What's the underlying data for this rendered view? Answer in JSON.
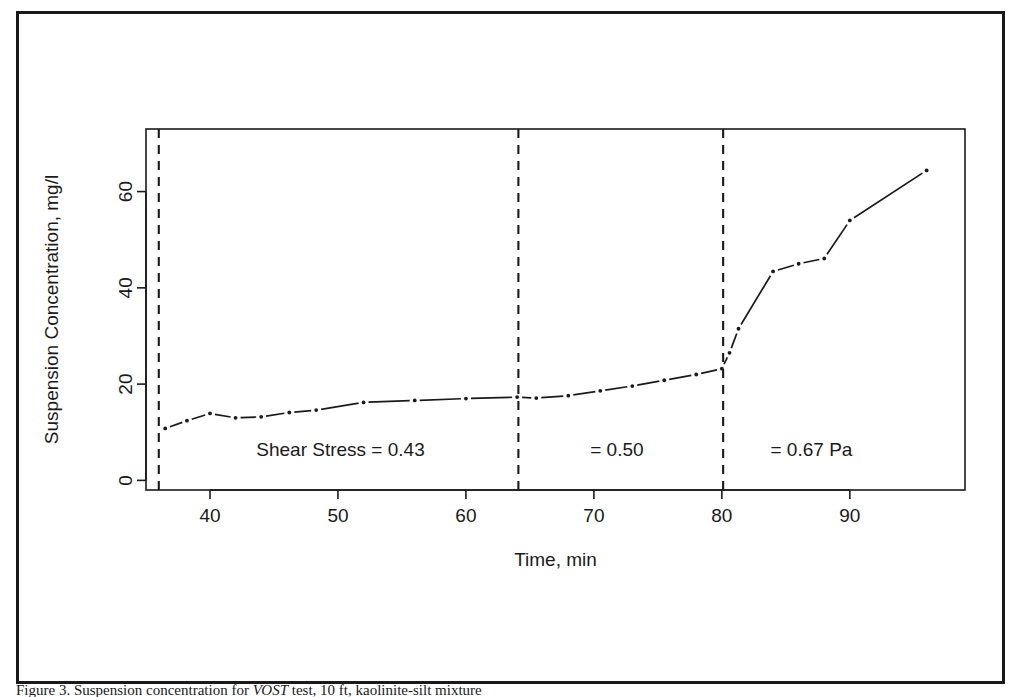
{
  "figure": {
    "caption_prefix": "Figure 3.",
    "caption_text": "Suspension concentration for",
    "caption_emphasis": "VOST",
    "caption_rest": "test, 10 ft, kaolinite-silt mixture"
  },
  "chart_data": {
    "type": "scatter",
    "title": "",
    "subtitle": "",
    "xlabel": "Time, min",
    "ylabel": "Suspension Concentration, mg/l",
    "xlim": [
      35.0,
      99.0
    ],
    "ylim": [
      -2.0,
      73.0
    ],
    "xticks": [
      40,
      50,
      60,
      70,
      80,
      90
    ],
    "yticks": [
      0,
      20,
      40,
      60
    ],
    "xtick_labels": [
      "40",
      "50",
      "60",
      "70",
      "80",
      "90"
    ],
    "ytick_labels": [
      "0",
      "20",
      "40",
      "60"
    ],
    "grid": false,
    "legend": "none",
    "marker": "point",
    "line_style": "solid-with-gaps",
    "series": [
      {
        "name": "Suspension concentration",
        "x": [
          36.5,
          38.2,
          40.0,
          42.0,
          44.0,
          46.2,
          48.3,
          52.0,
          56.0,
          60.0,
          64.0,
          65.5,
          68.0,
          70.5,
          73.0,
          75.5,
          78.0,
          80.0,
          80.6,
          81.3,
          84.0,
          86.0,
          88.0,
          90.0,
          96.0
        ],
        "y": [
          10.8,
          12.4,
          13.9,
          13.0,
          13.2,
          14.1,
          14.6,
          16.2,
          16.6,
          17.0,
          17.3,
          17.1,
          17.6,
          18.6,
          19.6,
          20.8,
          22.0,
          23.2,
          26.5,
          31.5,
          43.4,
          45.0,
          46.1,
          54.0,
          64.4
        ]
      }
    ],
    "annotations": [
      {
        "name": "shear-stress-label-1",
        "text": "Shear Stress = 0.43",
        "x": 50.2,
        "y": 5.0
      },
      {
        "name": "shear-stress-label-2",
        "text": "= 0.50",
        "x": 71.8,
        "y": 5.0
      },
      {
        "name": "shear-stress-label-3",
        "text": "= 0.67 Pa",
        "x": 87.0,
        "y": 5.0
      }
    ],
    "vlines": [
      {
        "name": "regime-divider-1",
        "x": 36.0,
        "style": "dashed"
      },
      {
        "name": "regime-divider-2",
        "x": 64.1,
        "style": "dashed"
      },
      {
        "name": "regime-divider-3",
        "x": 80.1,
        "style": "dashed"
      }
    ],
    "colors": {
      "line": "#1a1a1a",
      "marker": "#1a1a1a",
      "axis": "#1a1a1a",
      "background": "#ffffff",
      "frame": "#1a1a1a"
    }
  }
}
